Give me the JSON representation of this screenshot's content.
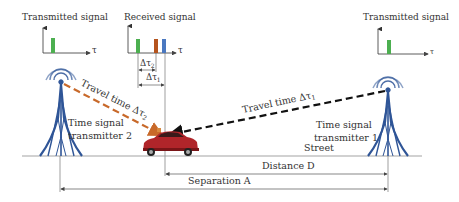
{
  "diagram": {
    "colors": {
      "green_pulse": "#4caf50",
      "orange_pulse": "#b5541d",
      "blue_pulse": "#4a78c0",
      "tower": "#2f5597",
      "path_tx2": "#c8692a",
      "path_tx1": "#111111",
      "car": "#b0252a",
      "line": "#555555"
    },
    "signals": {
      "left_transmitted": {
        "title": "Transmitted signal",
        "axis_label": "τ"
      },
      "received": {
        "title": "Received signal",
        "axis_label": "τ",
        "delta_tau_2": "Δτ",
        "delta_tau_2_sub": "2",
        "delta_tau_1": "Δτ",
        "delta_tau_1_sub": "1"
      },
      "right_transmitted": {
        "title": "Transmitted signal",
        "axis_label": "τ"
      }
    },
    "paths": {
      "tx2_label": "Travel time Δτ",
      "tx2_sub": "2",
      "tx1_label": "Travel time Δτ",
      "tx1_sub": "1"
    },
    "transmitters": {
      "tx2_line1": "Time signal",
      "tx2_line2": "transmitter 2",
      "tx1_line1": "Time signal",
      "tx1_line2": "transmitter 1"
    },
    "ground": {
      "street": "Street",
      "distance": "Distance D",
      "separation": "Separation A"
    }
  }
}
